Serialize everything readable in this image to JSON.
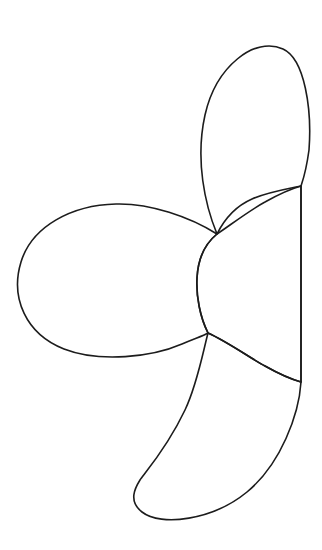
{
  "figure": {
    "title": "Three-lobed petal rosette outline",
    "background_color": "#ffffff",
    "stroke_color": "#1c1c1c",
    "stroke_width": "1.6",
    "fill": "none",
    "canvas": {
      "width": 322,
      "height": 550
    },
    "geometry": {
      "center_upper_junction": "217,234",
      "center_lower_junction": "208,333",
      "right_edge_top_junction": "301,186",
      "right_edge_bottom_junction": "301,382",
      "vertical_edge_x": 301,
      "left_lobe_extent_x": 20,
      "top_lobe_apex_y": 38,
      "bottom_lobe_base_y": 518
    },
    "lobes": [
      {
        "name": "top-lobe",
        "label": "Upper petal",
        "path": "M217,234 C205,205 195,160 205,115 C216,66 255,36 283,49 C305,59 312,110 309,150 C306,172 303,180 301,186 L301,186 C292,188 268,192 252,199 C236,206 224,220 217,234 Z"
      },
      {
        "name": "left-lobe",
        "label": "Left petal",
        "path": "M217,234 C190,217 150,203 116,204 C72,205 32,226 21,262 C10,298 26,334 64,349 C100,363 152,357 182,344 C196,338 203,336 208,333 C200,317 196,296 197,278 C198,258 206,243 217,234 Z"
      },
      {
        "name": "right-lobe",
        "label": "Right petal",
        "path": "M217,234 C229,226 250,210 265,202 C281,193 294,188 301,186 L301,382 C294,380 281,375 265,366 C250,358 228,342 208,333 C200,317 196,296 197,278 C198,258 206,243 217,234 Z"
      },
      {
        "name": "bottom-lobe",
        "label": "Lower petal",
        "path": "M208,333 C203,352 197,385 185,410 C167,448 144,474 140,480 C135,488 128,501 142,512 C161,527 213,520 247,492 C281,464 299,414 301,382 C294,380 281,375 265,366 C250,358 228,342 208,333 Z"
      }
    ],
    "strokes": [
      {
        "name": "right-vertical-edge",
        "label": "Straight vertical right edge",
        "path": "M301,186 L301,382"
      }
    ]
  }
}
